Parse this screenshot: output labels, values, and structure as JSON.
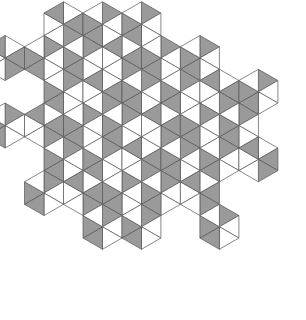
{
  "figure": {
    "type": "rhombus-tiling",
    "colors": {
      "background": "#ffffff",
      "gray_fill": "#9a9a9a",
      "white_fill": "#ffffff",
      "stroke": "#555555"
    },
    "lattice": {
      "origin_x": 83,
      "origin_y": 15,
      "edge": 22.5
    }
  }
}
